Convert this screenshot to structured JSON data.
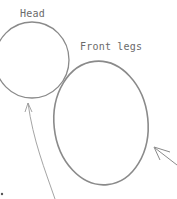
{
  "diagram": {
    "labels": {
      "head": "Head",
      "front_legs": "Front legs"
    },
    "colors": {
      "stroke": "#8a8a8a",
      "text": "#6a6a6a",
      "background": "#ffffff"
    }
  }
}
